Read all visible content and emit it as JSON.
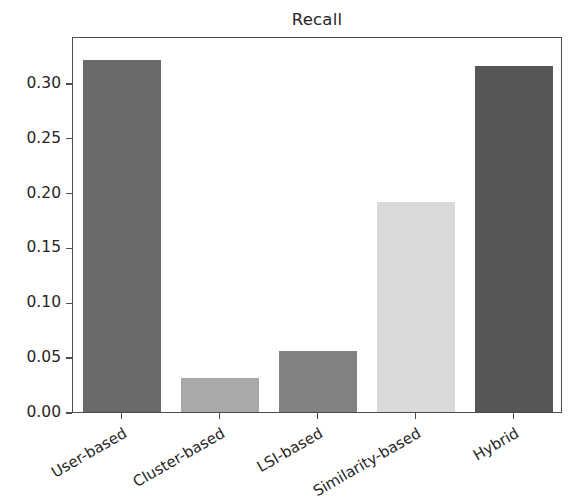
{
  "chart_data": {
    "type": "bar",
    "title": "Recall",
    "xlabel": "",
    "ylabel": "",
    "categories": [
      "User-based",
      "Cluster-based",
      "LSI-based",
      "Similarity-based",
      "Hybrid"
    ],
    "values": [
      0.321,
      0.031,
      0.056,
      0.191,
      0.315
    ],
    "bar_colors": [
      "#6a6a6a",
      "#a9a9a9",
      "#828282",
      "#d9d9d9",
      "#565656"
    ],
    "ylim": [
      0.0,
      0.3427
    ],
    "yticks": [
      0.0,
      0.05,
      0.1,
      0.15,
      0.2,
      0.25,
      0.3
    ],
    "ytick_labels": [
      "0.00",
      "0.05",
      "0.10",
      "0.15",
      "0.20",
      "0.25",
      "0.30"
    ],
    "grid": false,
    "legend": false,
    "legend_position": "none",
    "xtick_rotation": -30,
    "frame_color": "#4d4d4d",
    "background_color": "#ffffff",
    "text_color": "#262626"
  }
}
